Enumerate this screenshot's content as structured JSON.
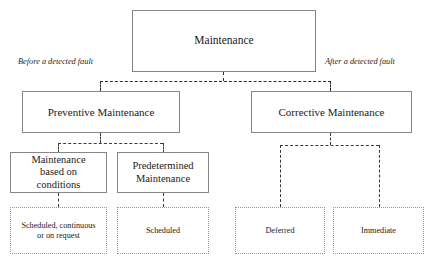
{
  "diagram": {
    "title": "Maintenance",
    "tiers": {
      "tier1": {
        "root": {
          "label": "Maintenance"
        }
      },
      "tier2": {
        "left": {
          "label": "Preventive Maintenance"
        },
        "right": {
          "label": "Corrective Maintenance"
        }
      },
      "tier3": {
        "condition_based": {
          "line1": "Maintenance",
          "line2": "based on",
          "line3": "conditions"
        },
        "predetermined": {
          "line1": "Predetermined",
          "line2": "Maintenance"
        }
      },
      "tier4": {
        "condition_based_outcome": {
          "line1": "Scheduled, continuous",
          "line2": "or on request"
        },
        "predetermined_outcome": {
          "label": "Scheduled"
        },
        "corrective_deferred": {
          "label": "Deferred"
        },
        "corrective_immediate": {
          "label": "Immediate"
        }
      }
    },
    "edge_labels": {
      "left": "Before a detected fault",
      "right": "After a detected fault"
    },
    "colors": {
      "box_border_solid": "#868686",
      "box_border_dotted": "#9a9a9a",
      "connector": "#2b2b2b",
      "text": "#1a1a1a",
      "background": "#ffffff"
    }
  }
}
